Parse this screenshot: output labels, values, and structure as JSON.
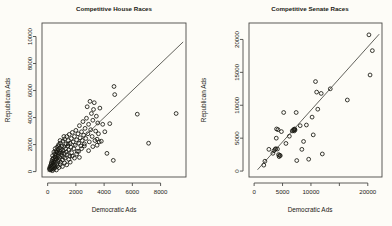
{
  "figure": {
    "background_color": "#fdfcf7",
    "foreground_color": "#17170f",
    "panel_count": 2
  },
  "chart_data": [
    {
      "type": "scatter",
      "title": "Competitive House Races",
      "xlabel": "Democratic Ads",
      "ylabel": "Republican Ads",
      "xlim": [
        -400,
        9800
      ],
      "ylim": [
        -400,
        11000
      ],
      "xticks": [
        0,
        2000,
        4000,
        6000,
        8000
      ],
      "yticks": [
        0,
        2000,
        4000,
        6000,
        8000,
        10000
      ],
      "xticklabels": [
        "0",
        "2000",
        "4000",
        "6000",
        "8000"
      ],
      "yticklabels": [
        "0",
        "2000",
        "4000",
        "6000",
        "8000",
        "10000"
      ],
      "grid": false,
      "legend": null,
      "marker": "open-circle",
      "annotations": [
        "diagonal reference line y = x"
      ],
      "reference_line": {
        "type": "line",
        "x": [
          0,
          9600
        ],
        "y": [
          0,
          9600
        ]
      },
      "points": [
        [
          120,
          180
        ],
        [
          150,
          300
        ],
        [
          180,
          120
        ],
        [
          200,
          420
        ],
        [
          210,
          260
        ],
        [
          240,
          520
        ],
        [
          250,
          150
        ],
        [
          260,
          640
        ],
        [
          280,
          340
        ],
        [
          300,
          760
        ],
        [
          310,
          200
        ],
        [
          330,
          900
        ],
        [
          340,
          480
        ],
        [
          350,
          1180
        ],
        [
          360,
          300
        ],
        [
          380,
          620
        ],
        [
          400,
          1000
        ],
        [
          410,
          380
        ],
        [
          430,
          760
        ],
        [
          440,
          1450
        ],
        [
          460,
          520
        ],
        [
          480,
          880
        ],
        [
          500,
          1300
        ],
        [
          510,
          420
        ],
        [
          530,
          1700
        ],
        [
          550,
          700
        ],
        [
          560,
          1080
        ],
        [
          580,
          1520
        ],
        [
          600,
          900
        ],
        [
          620,
          1250
        ],
        [
          640,
          560
        ],
        [
          660,
          1800
        ],
        [
          680,
          1020
        ],
        [
          700,
          1400
        ],
        [
          720,
          760
        ],
        [
          740,
          1620
        ],
        [
          760,
          1150
        ],
        [
          780,
          2000
        ],
        [
          800,
          880
        ],
        [
          820,
          1350
        ],
        [
          840,
          1750
        ],
        [
          860,
          1050
        ],
        [
          880,
          1480
        ],
        [
          900,
          2100
        ],
        [
          920,
          700
        ],
        [
          950,
          1600
        ],
        [
          980,
          1200
        ],
        [
          1000,
          1900
        ],
        [
          1020,
          1400
        ],
        [
          1050,
          860
        ],
        [
          1080,
          2250
        ],
        [
          1100,
          1550
        ],
        [
          1120,
          1100
        ],
        [
          1150,
          1850
        ],
        [
          1180,
          1350
        ],
        [
          1200,
          2400
        ],
        [
          1230,
          1000
        ],
        [
          1260,
          1700
        ],
        [
          1300,
          2050
        ],
        [
          1330,
          1450
        ],
        [
          1360,
          2600
        ],
        [
          1400,
          1250
        ],
        [
          1430,
          1900
        ],
        [
          1460,
          2300
        ],
        [
          1500,
          1600
        ],
        [
          1530,
          2750
        ],
        [
          1560,
          1150
        ],
        [
          1600,
          2100
        ],
        [
          1650,
          1800
        ],
        [
          1680,
          2450
        ],
        [
          1700,
          1400
        ],
        [
          1750,
          2900
        ],
        [
          1800,
          2200
        ],
        [
          1850,
          1700
        ],
        [
          1900,
          2600
        ],
        [
          1950,
          1950
        ],
        [
          2000,
          3050
        ],
        [
          2050,
          2350
        ],
        [
          2100,
          1500
        ],
        [
          2150,
          2800
        ],
        [
          2200,
          2100
        ],
        [
          2250,
          3400
        ],
        [
          2300,
          2500
        ],
        [
          2350,
          1900
        ],
        [
          2400,
          2950
        ],
        [
          2450,
          2300
        ],
        [
          2500,
          3700
        ],
        [
          2550,
          2700
        ],
        [
          2600,
          2050
        ],
        [
          2650,
          3200
        ],
        [
          2700,
          2450
        ],
        [
          2750,
          3950
        ],
        [
          2800,
          4800
        ],
        [
          2850,
          2800
        ],
        [
          2900,
          3500
        ],
        [
          2950,
          2200
        ],
        [
          3000,
          5200
        ],
        [
          3050,
          3100
        ],
        [
          3100,
          4300
        ],
        [
          3150,
          2600
        ],
        [
          3200,
          3800
        ],
        [
          3250,
          4600
        ],
        [
          3300,
          5100
        ],
        [
          3400,
          3000
        ],
        [
          3450,
          4100
        ],
        [
          3500,
          2400
        ],
        [
          3550,
          3600
        ],
        [
          3600,
          2800
        ],
        [
          3700,
          4700
        ],
        [
          3800,
          2250
        ],
        [
          3900,
          3500
        ],
        [
          4050,
          2950
        ],
        [
          4200,
          1350
        ],
        [
          4400,
          3550
        ],
        [
          4650,
          830
        ],
        [
          4700,
          6300
        ],
        [
          4750,
          5700
        ],
        [
          6350,
          4250
        ],
        [
          7150,
          2100
        ],
        [
          9100,
          4300
        ],
        [
          340,
          70
        ],
        [
          420,
          180
        ],
        [
          500,
          260
        ],
        [
          620,
          120
        ],
        [
          700,
          420
        ],
        [
          800,
          300
        ],
        [
          900,
          520
        ],
        [
          1050,
          380
        ],
        [
          1200,
          640
        ],
        [
          1350,
          500
        ],
        [
          1500,
          900
        ],
        [
          1600,
          700
        ],
        [
          1750,
          1150
        ],
        [
          1900,
          1000
        ],
        [
          2050,
          1300
        ],
        [
          2200,
          1500
        ],
        [
          2400,
          1700
        ],
        [
          2600,
          1900
        ],
        [
          2900,
          1550
        ],
        [
          3200,
          1850
        ],
        [
          3350,
          2300
        ],
        [
          3500,
          1950
        ],
        [
          3650,
          2200
        ],
        [
          2250,
          1050
        ],
        [
          1450,
          2050
        ],
        [
          1150,
          2600
        ],
        [
          880,
          2300
        ],
        [
          760,
          1900
        ],
        [
          640,
          1450
        ],
        [
          520,
          1100
        ]
      ]
    },
    {
      "type": "scatter",
      "title": "Competitive Senate Races",
      "xlabel": "Democratic Ads",
      "ylabel": "Republican Ads",
      "xlim": [
        -900,
        22500
      ],
      "ylim": [
        -900,
        22500
      ],
      "xticks": [
        0,
        5000,
        10000,
        15000,
        20000
      ],
      "yticks": [
        0,
        5000,
        10000,
        15000,
        20000
      ],
      "xticklabels": [
        "0",
        "5000",
        "10000",
        "",
        "20000"
      ],
      "yticklabels": [
        "0",
        "5000",
        "10000",
        "15000",
        "20000"
      ],
      "grid": false,
      "legend": null,
      "marker": "open-circle",
      "annotations": [
        "diagonal reference line y = x",
        "x tick 15000 label omitted"
      ],
      "reference_line": {
        "type": "line",
        "x": [
          600,
          22000
        ],
        "y": [
          200,
          20800
        ]
      },
      "points": [
        [
          1700,
          900
        ],
        [
          1900,
          1500
        ],
        [
          2600,
          3300
        ],
        [
          3300,
          2700
        ],
        [
          3500,
          3100
        ],
        [
          3700,
          3300
        ],
        [
          3800,
          3400
        ],
        [
          3900,
          5000
        ],
        [
          3950,
          6400
        ],
        [
          4100,
          3350
        ],
        [
          4200,
          6300
        ],
        [
          4300,
          2500
        ],
        [
          4400,
          2200
        ],
        [
          4500,
          2400
        ],
        [
          4600,
          2350
        ],
        [
          4800,
          6000
        ],
        [
          5200,
          8900
        ],
        [
          6700,
          6100
        ],
        [
          6900,
          6200
        ],
        [
          7000,
          6350
        ],
        [
          7050,
          6100
        ],
        [
          7150,
          6400
        ],
        [
          7200,
          6250
        ],
        [
          7400,
          8900
        ],
        [
          7500,
          1600
        ],
        [
          8100,
          6900
        ],
        [
          8700,
          4500
        ],
        [
          9200,
          7000
        ],
        [
          10200,
          8200
        ],
        [
          10400,
          5500
        ],
        [
          10800,
          13600
        ],
        [
          11000,
          12000
        ],
        [
          11200,
          9400
        ],
        [
          11800,
          11800
        ],
        [
          12000,
          2600
        ],
        [
          13400,
          12500
        ],
        [
          16400,
          10800
        ],
        [
          20200,
          20700
        ],
        [
          20400,
          14600
        ],
        [
          20800,
          18300
        ],
        [
          5600,
          4200
        ],
        [
          6200,
          5300
        ],
        [
          8400,
          3300
        ],
        [
          9600,
          1800
        ]
      ]
    }
  ]
}
